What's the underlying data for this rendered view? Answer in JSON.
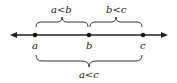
{
  "diagram": {
    "points": [
      {
        "label": "a",
        "x": 35
      },
      {
        "label": "b",
        "x": 89
      },
      {
        "label": "c",
        "x": 143
      }
    ],
    "top_braces": [
      {
        "label": "a<b",
        "from": "a",
        "to": "b"
      },
      {
        "label": "b<c",
        "from": "b",
        "to": "c"
      }
    ],
    "bottom_brace": {
      "label": "a<c",
      "from": "a",
      "to": "c"
    },
    "line_color": "#222222"
  }
}
